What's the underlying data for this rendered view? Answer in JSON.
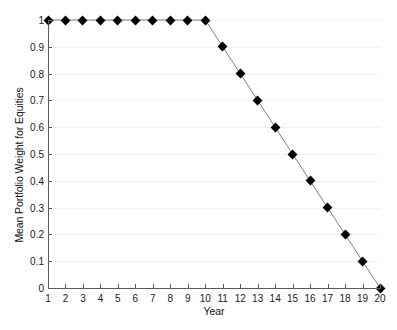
{
  "chart_data": {
    "type": "line",
    "title": "",
    "xlabel": "Year",
    "ylabel": "Mean Portfolio Weight for Equities",
    "x": [
      1,
      2,
      3,
      4,
      5,
      6,
      7,
      8,
      9,
      10,
      11,
      12,
      13,
      14,
      15,
      16,
      17,
      18,
      19,
      20
    ],
    "values": [
      1,
      1,
      1,
      1,
      1,
      1,
      1,
      1,
      1,
      1,
      0.9,
      0.8,
      0.7,
      0.6,
      0.5,
      0.4,
      0.3,
      0.2,
      0.1,
      0
    ],
    "series": [
      {
        "name": "Mean Portfolio Weight for Equities",
        "values": [
          1,
          1,
          1,
          1,
          1,
          1,
          1,
          1,
          1,
          1,
          0.9,
          0.8,
          0.7,
          0.6,
          0.5,
          0.4,
          0.3,
          0.2,
          0.1,
          0
        ]
      }
    ],
    "xtick_labels": [
      "1",
      "2",
      "3",
      "4",
      "5",
      "6",
      "7",
      "8",
      "9",
      "10",
      "11",
      "12",
      "13",
      "14",
      "15",
      "16",
      "17",
      "18",
      "19",
      "20"
    ],
    "ytick_labels": [
      "0",
      "0.1",
      "0.2",
      "0.3",
      "0.4",
      "0.5",
      "0.6",
      "0.7",
      "0.8",
      "0.9",
      "1"
    ],
    "ytick_values": [
      0,
      0.1,
      0.2,
      0.3,
      0.4,
      0.5,
      0.6,
      0.7,
      0.8,
      0.9,
      1
    ],
    "xlim": [
      1,
      20
    ],
    "ylim": [
      0,
      1
    ],
    "grid": true,
    "grid_axis": "y",
    "legend": null,
    "legend_position": "none",
    "marker": "diamond",
    "marker_color": "#000000",
    "line_color": "#808080",
    "grid_color": "#e3e3e3",
    "axis_color": "#5a5a5a",
    "background_color": "#ffffff"
  },
  "caption": {
    "remnant_text": ""
  }
}
